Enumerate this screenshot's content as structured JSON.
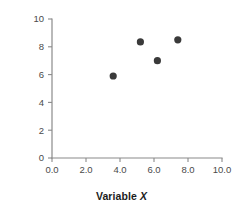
{
  "chart_data": {
    "type": "scatter",
    "title": "",
    "xlabel": "Variable X",
    "ylabel": "Variable Y",
    "xlim": [
      0.0,
      10.0
    ],
    "ylim": [
      0,
      10
    ],
    "xticks": [
      "0.0",
      "2.0",
      "4.0",
      "6.0",
      "8.0",
      "10.0"
    ],
    "xtick_values": [
      0.0,
      2.0,
      4.0,
      6.0,
      8.0,
      10.0
    ],
    "yticks": [
      "0",
      "2",
      "4",
      "6",
      "8",
      "10"
    ],
    "ytick_values": [
      0,
      2,
      4,
      6,
      8,
      10
    ],
    "grid": false,
    "legend": false,
    "marker": "filled-circle",
    "marker_color": "#3a3a3a",
    "axis_color": "#8a8a8a",
    "background": "#ffffff",
    "points": [
      {
        "x": 3.6,
        "y": 5.9
      },
      {
        "x": 5.2,
        "y": 8.35
      },
      {
        "x": 6.2,
        "y": 7.0
      },
      {
        "x": 7.4,
        "y": 8.5
      }
    ]
  },
  "labels": {
    "x_axis_title_prefix": "Variable ",
    "x_axis_title_var": "X",
    "y_axis_title_prefix": "Variable ",
    "y_axis_title_var": "Y"
  }
}
